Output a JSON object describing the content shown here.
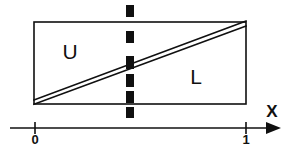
{
  "figure": {
    "title": "",
    "background_color": "#ffffff",
    "stroke_color": "#101010",
    "regions": [
      {
        "id": "upper",
        "label": "U",
        "cx": 70,
        "cy": 52
      },
      {
        "id": "lower",
        "label": "L",
        "cx": 196,
        "cy": 77
      }
    ],
    "rectangle": {
      "x0": 34,
      "y0": 22,
      "x1": 246,
      "y1": 104,
      "stroke_width": 1.6
    },
    "diagonal_band": {
      "description": "thin band from bottom-left corner to top-right corner",
      "upper_line": {
        "x0": 34,
        "y0": 100,
        "x1": 246,
        "y1": 21
      },
      "lower_line": {
        "x0": 34,
        "y0": 104,
        "x1": 246,
        "y1": 26
      },
      "stroke_width": 1.6
    },
    "dashed_line": {
      "x": 130,
      "y_top": 5,
      "y_bottom": 118,
      "dash_width": 8,
      "dash_length": 11,
      "dash_gap": 9,
      "color": "#101010"
    },
    "axis": {
      "name": "X",
      "name_x": 272,
      "name_y": 113,
      "y": 128,
      "x_start": 10,
      "x_end": 281,
      "stroke_width": 1.7,
      "arrow": {
        "tip_x": 281,
        "size": 9
      },
      "ticks": [
        {
          "label": "0",
          "x": 35,
          "label_y": 141
        },
        {
          "label": "1",
          "x": 246,
          "label_y": 141
        }
      ],
      "tick_half_height": 6
    }
  }
}
